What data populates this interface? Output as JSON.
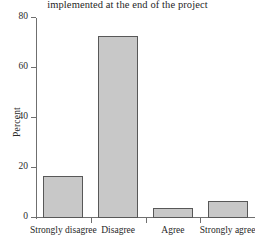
{
  "chart_data": {
    "type": "bar",
    "title": "implemented at the end of the project",
    "title_note": "second line of a two-line title; first line is cropped off the top of the image",
    "categories": [
      "Strongly disagree",
      "Disagree",
      "Agree",
      "Strongly agree"
    ],
    "values": [
      17,
      73,
      4,
      7
    ],
    "xlabel": "",
    "ylabel": "Percent",
    "ylim": [
      0,
      80
    ],
    "yticks": [
      0,
      20,
      40,
      60,
      80
    ],
    "ytick_labels": [
      "0",
      "20",
      "40",
      "60",
      "80"
    ],
    "grid": false,
    "legend": false,
    "series": [
      {
        "name": "Percent",
        "values": [
          17,
          73,
          4,
          7
        ]
      }
    ],
    "bar_fill_color": "#c8c8c8",
    "bar_border_color": "#585858",
    "axis_color": "#6f6f6f"
  }
}
